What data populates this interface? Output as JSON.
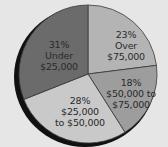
{
  "chart_data": {
    "type": "pie",
    "title": "",
    "categories": [
      "Over $75,000",
      "$50,000 to $75,000",
      "$25,000 to $50,000",
      "Under $25,000"
    ],
    "values": [
      23,
      18,
      28,
      31
    ],
    "unit": "%",
    "slices": [
      {
        "pct": "23%",
        "line1": "Over",
        "line2": "$75,000",
        "value": 23,
        "color": "#b4b4b4"
      },
      {
        "pct": "18%",
        "line1": "$50,000 to",
        "line2": "$75,000",
        "value": 18,
        "color": "#9d9d9d"
      },
      {
        "pct": "28%",
        "line1": "$25,000",
        "line2": "to $50,000",
        "value": 28,
        "color": "#c9c9c9"
      },
      {
        "pct": "31%",
        "line1": "Under",
        "line2": "$25,000",
        "value": 31,
        "color": "#6b6b6b"
      }
    ],
    "legend": "none (labels inside slices)"
  }
}
